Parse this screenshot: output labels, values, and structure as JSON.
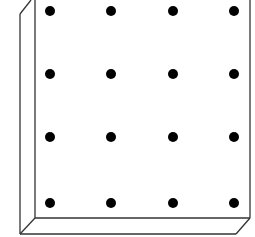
{
  "diagram": {
    "type": "geoboard",
    "rows": 4,
    "cols": 4,
    "dot_x": [
      50,
      111,
      173,
      234
    ],
    "dot_y": [
      11,
      74,
      137,
      203
    ],
    "dot_radius": 5,
    "colors": {
      "line": "#333333",
      "dot": "#000000",
      "background": "#ffffff"
    }
  }
}
